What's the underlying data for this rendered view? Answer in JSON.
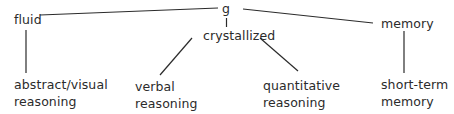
{
  "diagram": {
    "type": "hierarchy-tree",
    "root": {
      "id": "g",
      "label": "g"
    },
    "nodes": [
      {
        "id": "g",
        "label": "g"
      },
      {
        "id": "fluid",
        "label": "fluid"
      },
      {
        "id": "crystallized",
        "label": "crystallized"
      },
      {
        "id": "memory",
        "label": "memory"
      },
      {
        "id": "abstract_visual",
        "lines": [
          "abstract/visual",
          "reasoning"
        ]
      },
      {
        "id": "verbal",
        "lines": [
          "verbal",
          "reasoning"
        ]
      },
      {
        "id": "quantitative",
        "lines": [
          "quantitative",
          "reasoning"
        ]
      },
      {
        "id": "short_term",
        "lines": [
          "short-term",
          "memory"
        ]
      }
    ],
    "edges": [
      {
        "from": "g",
        "to": "fluid"
      },
      {
        "from": "g",
        "to": "crystallized"
      },
      {
        "from": "g",
        "to": "memory"
      },
      {
        "from": "fluid",
        "to": "abstract_visual"
      },
      {
        "from": "crystallized",
        "to": "verbal"
      },
      {
        "from": "crystallized",
        "to": "quantitative"
      },
      {
        "from": "memory",
        "to": "short_term"
      }
    ],
    "colors": {
      "line": "#2b2b2b",
      "text": "#2b2b2b",
      "background": "#ffffff"
    }
  }
}
